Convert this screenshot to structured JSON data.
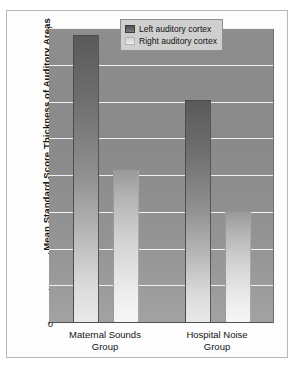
{
  "chart_data": {
    "type": "bar",
    "title": "",
    "subtitle": "",
    "xlabel": "",
    "ylabel": "Mean Standard Score Thickness of Auditory Areas",
    "categories": [
      "Maternal Sounds Group",
      "Hospital Noise Group"
    ],
    "category_lines": [
      [
        "Maternal Sounds",
        "Group"
      ],
      [
        "Hospital Noise",
        "Group"
      ]
    ],
    "series": [
      {
        "name": "Left auditory cortex",
        "values": [
          7.8,
          6.05
        ],
        "color": "#5a5a5a"
      },
      {
        "name": "Right auditory cortex",
        "values": [
          4.15,
          3.0
        ],
        "color": "#d2d2d2"
      }
    ],
    "ylim": [
      0,
      8
    ],
    "yticks": [
      8,
      7,
      6,
      5,
      4,
      3,
      2,
      1,
      0
    ],
    "ytick_labels": [
      "8",
      "7",
      "6",
      "5",
      "4",
      "3",
      "2",
      "1",
      "0"
    ],
    "grid": true,
    "grid_orientation": "horizontal",
    "grid_color": "#f2f2f2",
    "legend_position": "top-right",
    "plot_background": "#8a8a8a",
    "figure_background": "#fdfdfd",
    "frame_color": "#b8b8b8"
  },
  "legend": {
    "entries": [
      {
        "label": "Left auditory cortex",
        "swatch": "left-cortex-swatch"
      },
      {
        "label": "Right auditory cortex",
        "swatch": "right-cortex-swatch"
      }
    ]
  }
}
